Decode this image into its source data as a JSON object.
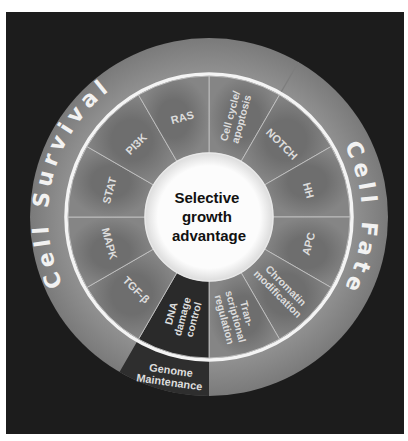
{
  "diagram": {
    "center": {
      "lines": [
        "Selective",
        "growth",
        "advantage"
      ]
    },
    "outer_ring": {
      "arcs": [
        {
          "label": "Cell Survival",
          "start_deg": 210,
          "end_deg": 390
        },
        {
          "label": "Cell Fate",
          "start_deg": 30,
          "end_deg": 180
        },
        {
          "label_lines": [
            "Genome",
            "Maintenance"
          ],
          "start_deg": 180,
          "end_deg": 210
        }
      ]
    },
    "segments": [
      {
        "label_lines": [
          "Cell cycle/",
          "apoptosis"
        ],
        "group": "Cell Fate"
      },
      {
        "label_lines": [
          "NOTCH"
        ],
        "group": "Cell Fate"
      },
      {
        "label_lines": [
          "HH"
        ],
        "group": "Cell Fate"
      },
      {
        "label_lines": [
          "APC"
        ],
        "group": "Cell Fate"
      },
      {
        "label_lines": [
          "Chromatin",
          "modification"
        ],
        "group": "Cell Fate"
      },
      {
        "label_lines": [
          "Tran-",
          "scriptional",
          "regulation"
        ],
        "group": "Cell Fate"
      },
      {
        "label_lines": [
          "DNA",
          "damage",
          "control"
        ],
        "group": "Genome Maintenance"
      },
      {
        "label_lines": [
          "TGF-β"
        ],
        "group": "Cell Survival"
      },
      {
        "label_lines": [
          "MAPK"
        ],
        "group": "Cell Survival"
      },
      {
        "label_lines": [
          "STAT"
        ],
        "group": "Cell Survival"
      },
      {
        "label_lines": [
          "PI3K"
        ],
        "group": "Cell Survival"
      },
      {
        "label_lines": [
          "RAS"
        ],
        "group": "Cell Survival"
      }
    ],
    "colors": {
      "background": "#1c1c1c",
      "outer_ring": "#8c8c8c",
      "segment": "#7c7c7c",
      "segment_dark": "#2a2a2a",
      "genome_band": "#2e2e2e",
      "separator": "#f4f4f4",
      "center": "#fafafa"
    }
  }
}
